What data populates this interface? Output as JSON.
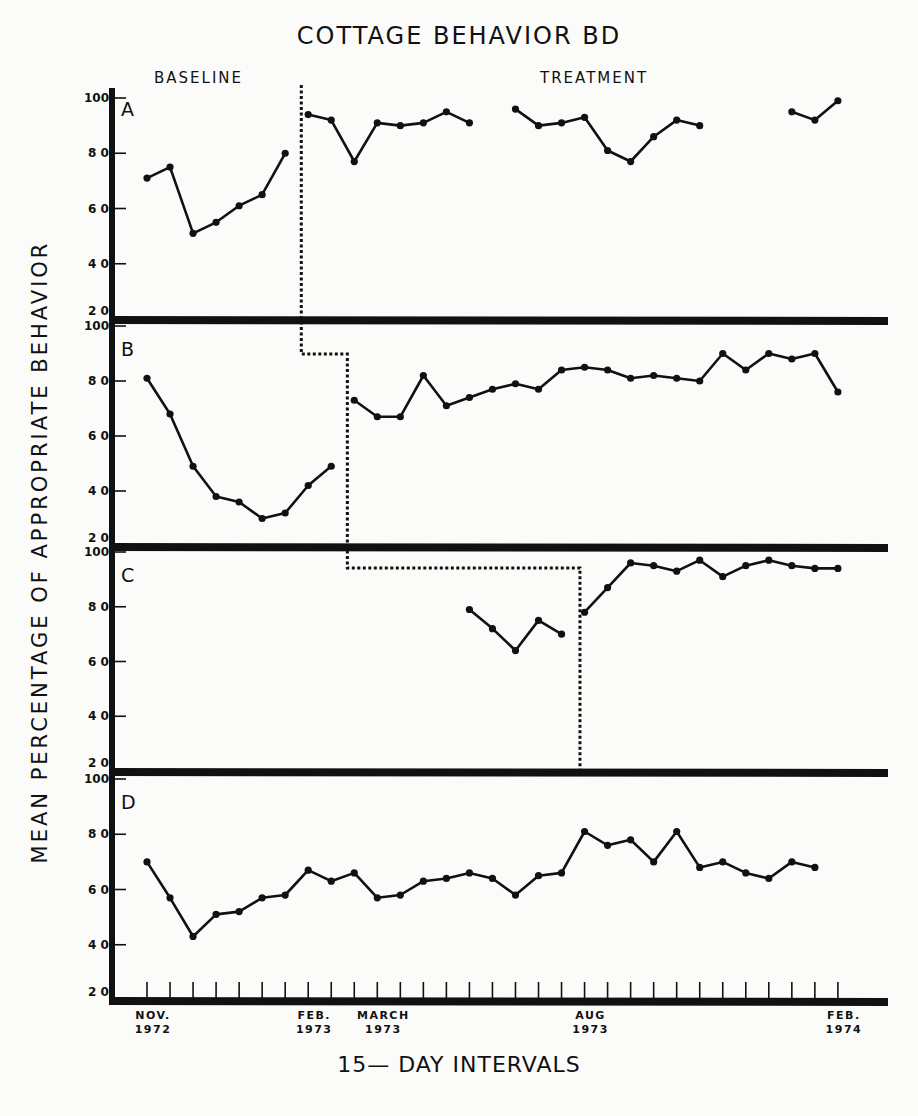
{
  "chart_data": {
    "type": "line",
    "title": "COTTAGE BEHAVIOR BD",
    "xlabel": "15— DAY INTERVALS",
    "ylabel": "MEAN PERCENTAGE OF APPROPRIATE BEHAVIOR",
    "phase_labels": [
      "BASELINE",
      "TREATMENT"
    ],
    "ylim": [
      20,
      100
    ],
    "yticks": [
      20,
      40,
      60,
      80,
      100
    ],
    "x_intervals": 31,
    "x_date_labels": [
      {
        "index": 0,
        "line1": "NOV.",
        "line2": "1972"
      },
      {
        "index": 7,
        "line1": "FEB.",
        "line2": "1973"
      },
      {
        "index": 10,
        "line1": "MARCH",
        "line2": "1973"
      },
      {
        "index": 19,
        "line1": "AUG",
        "line2": "1973"
      },
      {
        "index": 30,
        "line1": "FEB.",
        "line2": "1974"
      }
    ],
    "grid": false,
    "legend": "none",
    "phase_change_line": {
      "style": "dashed",
      "A": 6.7,
      "B": 8.7,
      "C": 18.8,
      "D": null
    },
    "panels": [
      {
        "name": "A",
        "segments": [
          {
            "phase": "baseline",
            "x": [
              0,
              1,
              2,
              3,
              4,
              5,
              6
            ],
            "y": [
              71,
              75,
              51,
              55,
              61,
              65,
              80
            ]
          },
          {
            "phase": "treatment",
            "x": [
              7,
              8,
              9,
              10,
              11,
              12,
              13,
              14
            ],
            "y": [
              94,
              92,
              77,
              91,
              90,
              91,
              95,
              91
            ]
          },
          {
            "phase": "treatment",
            "x": [
              16,
              17,
              18,
              19,
              20,
              21,
              22,
              23,
              24
            ],
            "y": [
              96,
              90,
              91,
              93,
              81,
              77,
              86,
              92,
              90
            ]
          },
          {
            "phase": "treatment",
            "x": [
              28,
              29,
              30
            ],
            "y": [
              95,
              92,
              99
            ]
          }
        ]
      },
      {
        "name": "B",
        "segments": [
          {
            "phase": "baseline",
            "x": [
              0,
              1,
              2,
              3,
              4,
              5,
              6,
              7,
              8
            ],
            "y": [
              81,
              68,
              49,
              38,
              36,
              30,
              32,
              42,
              49
            ]
          },
          {
            "phase": "treatment",
            "x": [
              9,
              10,
              11,
              12,
              13,
              14,
              15,
              16,
              17,
              18,
              19,
              20,
              21,
              22,
              23,
              24,
              25,
              26,
              27,
              28,
              29,
              30
            ],
            "y": [
              73,
              67,
              67,
              82,
              71,
              74,
              77,
              79,
              77,
              84,
              85,
              84,
              81,
              82,
              81,
              80,
              90,
              84,
              90,
              88,
              90,
              76
            ]
          }
        ]
      },
      {
        "name": "C",
        "segments": [
          {
            "phase": "baseline",
            "x": [
              14,
              15,
              16,
              17,
              18
            ],
            "y": [
              79,
              72,
              64,
              75,
              70
            ]
          },
          {
            "phase": "treatment",
            "x": [
              19,
              20,
              21,
              22,
              23,
              24,
              25,
              26,
              27,
              28,
              29,
              30
            ],
            "y": [
              78,
              87,
              96,
              95,
              93,
              97,
              91,
              95,
              97,
              95,
              94,
              94
            ]
          }
        ]
      },
      {
        "name": "D",
        "segments": [
          {
            "phase": "baseline",
            "x": [
              0,
              1,
              2,
              3,
              4,
              5,
              6,
              7,
              8,
              9,
              10,
              11,
              12,
              13,
              14,
              15,
              16,
              17,
              18,
              19,
              20,
              21,
              22,
              23,
              24,
              25,
              26,
              27,
              28,
              29
            ],
            "y": [
              70,
              57,
              43,
              51,
              52,
              57,
              58,
              67,
              63,
              66,
              57,
              58,
              63,
              64,
              66,
              64,
              58,
              65,
              66,
              81,
              76,
              78,
              70,
              81,
              68,
              70,
              66,
              64,
              70,
              68
            ]
          }
        ]
      }
    ]
  },
  "header": {
    "title": "COTTAGE BEHAVIOR BD",
    "baseline_label": "BASELINE",
    "treatment_label": "TREATMENT"
  },
  "axes": {
    "ylabel": "MEAN PERCENTAGE OF APPROPRIATE BEHAVIOR",
    "xlabel": "15— DAY INTERVALS"
  }
}
